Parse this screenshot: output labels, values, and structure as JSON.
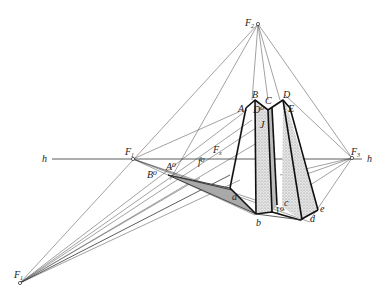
{
  "diagram": {
    "type": "perspective construction of prismatic solids",
    "horizon": {
      "label_left": "h",
      "label_right": "h"
    },
    "vanishing_points": [
      {
        "name": "F1",
        "label": "F",
        "sub": "1"
      },
      {
        "name": "F2",
        "label": "F",
        "sub": "2"
      },
      {
        "name": "F3",
        "label": "F",
        "sub": "3"
      },
      {
        "name": "Fx",
        "label": "F",
        "sub": "x"
      },
      {
        "name": "F1_low",
        "label": "F",
        "sub": "1"
      }
    ],
    "points_upper": [
      "A",
      "B",
      "C",
      "D",
      "E",
      "D⁰",
      "J"
    ],
    "points_lower": [
      "a",
      "b",
      "c",
      "d",
      "e",
      "1⁰"
    ],
    "points_other": [
      "A⁰",
      "B⁰",
      "f⁰"
    ],
    "colors": {
      "line": "#222222",
      "shade_dark": "#a9a9a9",
      "shade_dots": "#cfcfcf",
      "background": "#ffffff"
    }
  }
}
